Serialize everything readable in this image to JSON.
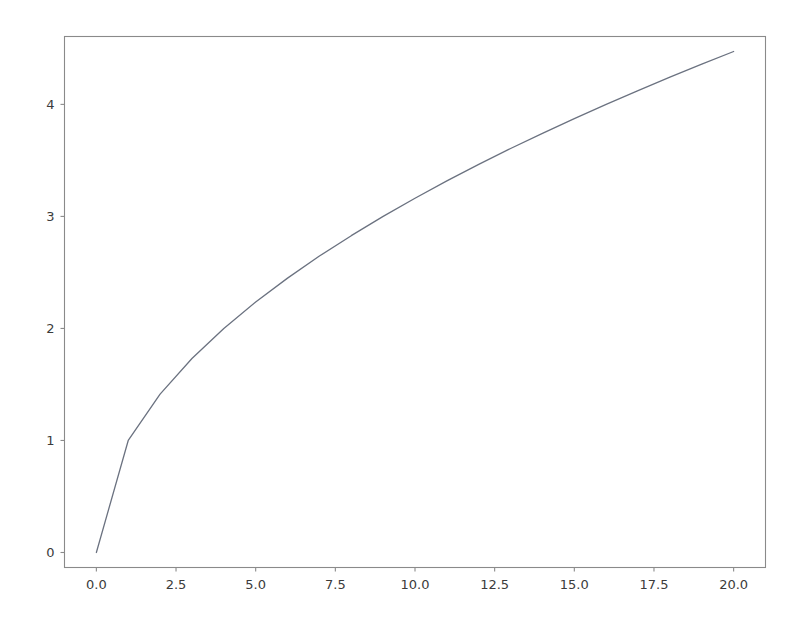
{
  "chart_data": {
    "type": "line",
    "title": "",
    "xlabel": "",
    "ylabel": "",
    "xlim": [
      -1.0,
      21.0
    ],
    "ylim": [
      -0.134,
      4.606
    ],
    "grid": false,
    "legend": null,
    "line_color": "#6b7280",
    "background_color": "#ffffff",
    "spine_color": "#8a8a8a",
    "tick_label_color": "#3b3b3b",
    "xticks": [
      0.0,
      2.5,
      5.0,
      7.5,
      10.0,
      12.5,
      15.0,
      17.5,
      20.0
    ],
    "xtick_labels": [
      "0.0",
      "2.5",
      "5.0",
      "7.5",
      "10.0",
      "12.5",
      "15.0",
      "17.5",
      "20.0"
    ],
    "yticks": [
      0,
      1,
      2,
      3,
      4
    ],
    "ytick_labels": [
      "0",
      "1",
      "2",
      "3",
      "4"
    ],
    "series": [
      {
        "name": "sqrt(x)",
        "x": [
          0,
          1,
          2,
          3,
          4,
          5,
          6,
          7,
          8,
          9,
          10,
          11,
          12,
          13,
          14,
          15,
          16,
          17,
          18,
          19,
          20
        ],
        "values": [
          0.0,
          1.0,
          1.414,
          1.732,
          2.0,
          2.236,
          2.449,
          2.646,
          2.828,
          3.0,
          3.162,
          3.317,
          3.464,
          3.606,
          3.742,
          3.873,
          4.0,
          4.123,
          4.243,
          4.359,
          4.472
        ]
      }
    ]
  }
}
